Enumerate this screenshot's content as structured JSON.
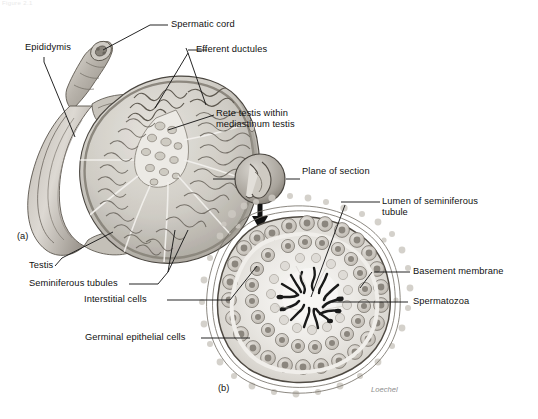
{
  "figure": {
    "title_fragment": "Figure 2.1",
    "signature": "Loechel",
    "panels": [
      {
        "id": "a",
        "label": "(a)",
        "subject": "Sagittal section of testis and epididymis"
      },
      {
        "id": "b",
        "label": "(b)",
        "subject": "Cross section of a seminiferous tubule"
      }
    ]
  },
  "labels": {
    "spermatic_cord": "Spermatic cord",
    "epididymis": "Epididymis",
    "efferent_ductules": "Efferent ductules",
    "rete_testis_line1": "Rete testis within",
    "rete_testis_line2": "mediastinum testis",
    "plane_of_section": "Plane of section",
    "testis": "Testis",
    "seminiferous_tubules": "Seminiferous tubules",
    "interstitial_cells": "Interstitial cells",
    "germinal_epithelial_cells": "Germinal epithelial cells",
    "lumen_line1": "Lumen of seminiferous",
    "lumen_line2": "tubule",
    "basement_membrane": "Basement membrane",
    "spermatozoa": "Spermatozoa"
  },
  "icons": {
    "magnifier_inset": "magnification-circle-icon",
    "flow_arrow": "down-arrow-icon"
  },
  "colors": {
    "ink": "#111111",
    "leader": "#1a1a1a",
    "tissue_light": "#d9d6d0",
    "tissue_mid": "#a9a49c",
    "tissue_dark": "#6f6a63",
    "outline": "#4a4640",
    "cell_fill": "#d2cfc9",
    "nucleus": "#8b867e",
    "lumen": "#f3f1ee",
    "sperm": "#1b1b1b",
    "signature": "#8e8e8e",
    "background": "#ffffff"
  }
}
